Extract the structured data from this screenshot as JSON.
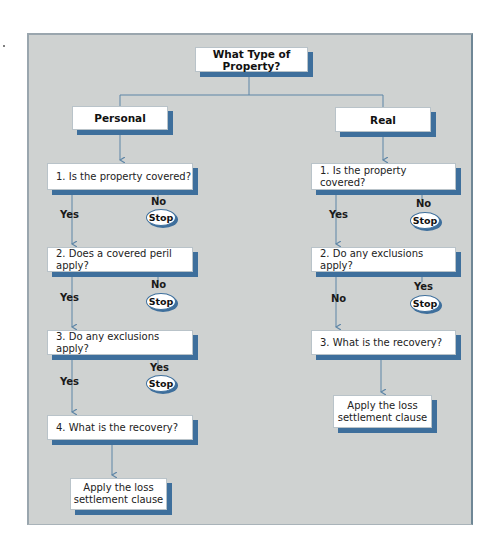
{
  "root": {
    "label": "What Type of Property?"
  },
  "branches": [
    {
      "label": "Personal",
      "steps": [
        {
          "text": "1.  Is the property covered?",
          "continue_label": "Yes",
          "stop_label": "No",
          "stop_text": "Stop"
        },
        {
          "text": "2.  Does a covered peril apply?",
          "continue_label": "Yes",
          "stop_label": "No",
          "stop_text": "Stop"
        },
        {
          "text": "3.  Do any exclusions apply?",
          "continue_label": "Yes",
          "stop_label": "Yes",
          "stop_text": "Stop"
        },
        {
          "text": "4.  What is the recovery?"
        }
      ],
      "result": {
        "line1": "Apply the loss",
        "line2": "settlement clause"
      }
    },
    {
      "label": "Real",
      "steps": [
        {
          "text": "1.  Is the property covered?",
          "continue_label": "Yes",
          "stop_label": "No",
          "stop_text": "Stop"
        },
        {
          "text": "2.  Do any exclusions apply?",
          "continue_label": "No",
          "stop_label": "Yes",
          "stop_text": "Stop"
        },
        {
          "text": "3.  What is the recovery?"
        }
      ],
      "result": {
        "line1": "Apply the loss",
        "line2": "settlement clause"
      }
    }
  ],
  "colors": {
    "panel": "#cfd2d1",
    "shadow": "#3e6f9c",
    "connector": "#5d85a6"
  }
}
